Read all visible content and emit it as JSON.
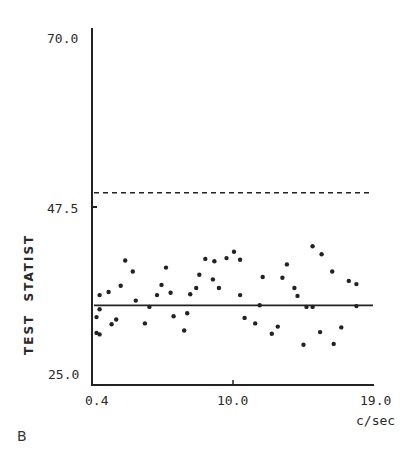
{
  "panel_label": "B",
  "chart_data": {
    "type": "scatter",
    "title": "",
    "xlabel": "c/sec",
    "ylabel": "TEST  STATIST",
    "xlim": [
      0.4,
      19.0
    ],
    "ylim": [
      25.0,
      70.0
    ],
    "x_ticks": [
      "0.4",
      "10.0",
      "19.0"
    ],
    "y_ticks": [
      "70.0",
      "47.5",
      "25.0"
    ],
    "grid": false,
    "reference_lines": [
      {
        "name": "threshold",
        "style": "dashed",
        "y": 49.3
      },
      {
        "name": "mean",
        "style": "solid",
        "y": 35.0
      }
    ],
    "series": [
      {
        "name": "test statistic",
        "points": [
          [
            0.7,
            33.5
          ],
          [
            0.7,
            31.5
          ],
          [
            0.9,
            31.3
          ],
          [
            0.9,
            34.5
          ],
          [
            0.9,
            36.3
          ],
          [
            1.5,
            36.7
          ],
          [
            1.7,
            32.6
          ],
          [
            2.0,
            33.2
          ],
          [
            2.3,
            37.5
          ],
          [
            2.6,
            40.7
          ],
          [
            3.1,
            39.3
          ],
          [
            3.3,
            35.6
          ],
          [
            3.9,
            32.7
          ],
          [
            4.2,
            34.8
          ],
          [
            4.7,
            36.3
          ],
          [
            5.0,
            37.6
          ],
          [
            5.3,
            39.8
          ],
          [
            5.6,
            36.6
          ],
          [
            5.8,
            33.6
          ],
          [
            6.5,
            31.8
          ],
          [
            6.7,
            34.0
          ],
          [
            6.9,
            36.4
          ],
          [
            7.3,
            37.2
          ],
          [
            7.5,
            38.9
          ],
          [
            7.9,
            40.9
          ],
          [
            8.4,
            38.3
          ],
          [
            8.5,
            40.6
          ],
          [
            8.8,
            37.2
          ],
          [
            9.3,
            41.0
          ],
          [
            9.8,
            41.8
          ],
          [
            10.2,
            40.8
          ],
          [
            10.2,
            36.3
          ],
          [
            10.5,
            33.4
          ],
          [
            11.2,
            32.7
          ],
          [
            11.5,
            35.0
          ],
          [
            11.7,
            38.6
          ],
          [
            12.3,
            31.4
          ],
          [
            12.7,
            32.3
          ],
          [
            13.0,
            38.5
          ],
          [
            13.3,
            40.2
          ],
          [
            13.8,
            37.2
          ],
          [
            14.0,
            36.2
          ],
          [
            14.4,
            30.0
          ],
          [
            14.6,
            34.8
          ],
          [
            15.0,
            34.8
          ],
          [
            15.0,
            42.5
          ],
          [
            15.6,
            41.5
          ],
          [
            15.5,
            31.6
          ],
          [
            16.3,
            39.3
          ],
          [
            16.4,
            30.1
          ],
          [
            16.9,
            32.2
          ],
          [
            17.4,
            38.1
          ],
          [
            17.9,
            37.7
          ],
          [
            17.9,
            34.9
          ]
        ]
      }
    ]
  },
  "colors": {
    "ink": "#222222",
    "background": "#ffffff"
  }
}
